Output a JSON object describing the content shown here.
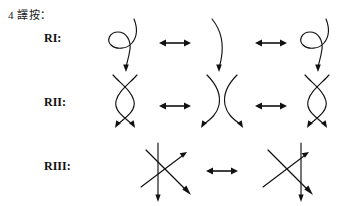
{
  "figure": {
    "note_header": "4 譯按：",
    "title_semantic": "reidemeister-moves",
    "background_color": "#ffffff",
    "ink_color": "#111111"
  },
  "rows": [
    {
      "id": "ri",
      "label": "RI:",
      "move_name": "Reidemeister move I",
      "panels": [
        {
          "id": "ri-left",
          "kind": "kink-loop-left",
          "description": "strand with a loop (kink) on the left, arrow pointing down"
        },
        {
          "id": "ri-middle",
          "kind": "plain-arc",
          "description": "single curved strand, arrow pointing down"
        },
        {
          "id": "ri-right",
          "kind": "kink-loop-left",
          "description": "strand with a loop (kink) on the left, arrow pointing down"
        }
      ],
      "connectors": [
        {
          "id": "ri-equiv-1",
          "glyph": "double-headed-arrow"
        },
        {
          "id": "ri-equiv-2",
          "glyph": "double-headed-arrow"
        }
      ]
    },
    {
      "id": "rii",
      "label": "RII:",
      "move_name": "Reidemeister move II",
      "panels": [
        {
          "id": "rii-left",
          "kind": "bigon-crossing",
          "description": "two strands crossing twice forming a bigon, two arrows pointing down"
        },
        {
          "id": "rii-middle",
          "kind": "separated-arcs",
          "description": "two separated arcs facing apart, two arrows pointing down"
        },
        {
          "id": "rii-right",
          "kind": "bigon-crossing",
          "description": "two strands crossing twice forming a bigon, two arrows pointing down"
        }
      ],
      "connectors": [
        {
          "id": "rii-equiv-1",
          "glyph": "double-headed-arrow"
        },
        {
          "id": "rii-equiv-2",
          "glyph": "double-headed-arrow"
        }
      ]
    },
    {
      "id": "riii",
      "label": "RIII:",
      "move_name": "Reidemeister move III",
      "panels": [
        {
          "id": "riii-left",
          "kind": "triple-crossing-line-left",
          "description": "three strands, vertical strand passing on the left of the crossing, three arrows"
        },
        {
          "id": "riii-right",
          "kind": "triple-crossing-line-right",
          "description": "three strands, vertical strand passing on the right of the crossing, three arrows"
        }
      ],
      "connectors": [
        {
          "id": "riii-equiv-1",
          "glyph": "double-headed-arrow"
        }
      ]
    }
  ]
}
